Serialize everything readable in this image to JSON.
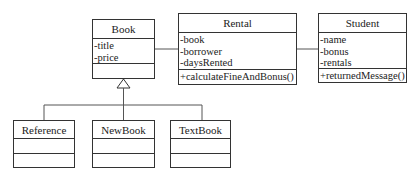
{
  "diagram": {
    "type": "uml-class-diagram",
    "classes": [
      {
        "id": "book",
        "name": "Book",
        "attributes": [
          "-title",
          "-price"
        ],
        "operations": []
      },
      {
        "id": "rental",
        "name": "Rental",
        "attributes": [
          "-book",
          "-borrower",
          "-daysRented"
        ],
        "operations": [
          "+calculateFineAndBonus()"
        ]
      },
      {
        "id": "student",
        "name": "Student",
        "attributes": [
          "-name",
          "-bonus",
          "-rentals"
        ],
        "operations": [
          "+returnedMessage()"
        ]
      },
      {
        "id": "reference",
        "name": "Reference",
        "attributes": [],
        "operations": []
      },
      {
        "id": "newbook",
        "name": "NewBook",
        "attributes": [],
        "operations": []
      },
      {
        "id": "textbook",
        "name": "TextBook",
        "attributes": [],
        "operations": []
      }
    ],
    "relationships": [
      {
        "type": "association",
        "from": "Book",
        "to": "Rental"
      },
      {
        "type": "association",
        "from": "Rental",
        "to": "Student"
      },
      {
        "type": "generalization",
        "from": "Reference",
        "to": "Book"
      },
      {
        "type": "generalization",
        "from": "NewBook",
        "to": "Book"
      },
      {
        "type": "generalization",
        "from": "TextBook",
        "to": "Book"
      }
    ]
  }
}
